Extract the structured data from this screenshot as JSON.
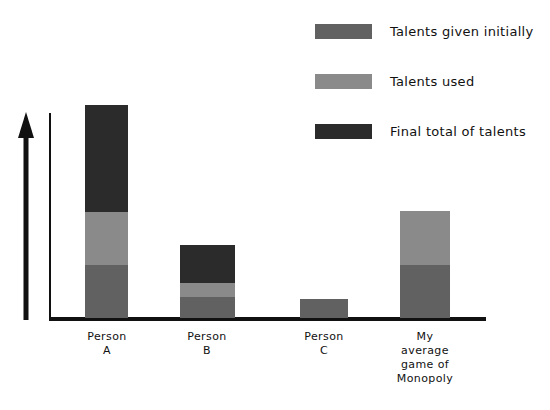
{
  "chart_data": {
    "type": "bar",
    "title": "",
    "xlabel": "",
    "ylabel": "",
    "stacked": true,
    "grid": false,
    "legend_position": "top-right",
    "y_axis": {
      "arrow": true,
      "ticks": [],
      "labels_shown": false,
      "range_hint": "unlabeled increasing axis"
    },
    "categories": [
      "Person\nA",
      "Person\nB",
      "Person\nC",
      "My\naverage\ngame of\nMonopoly"
    ],
    "series": [
      {
        "name": "Talents given initially",
        "color": "#616161",
        "values": [
          53,
          21,
          19,
          53
        ]
      },
      {
        "name": "Talents used",
        "color": "#8a8a8a",
        "values": [
          53,
          14,
          0,
          54
        ]
      },
      {
        "name": "Final total of talents",
        "color": "#2b2b2b",
        "values": [
          107,
          38,
          0,
          0
        ]
      }
    ]
  },
  "legend": {
    "items": [
      {
        "label": "Talents given initially",
        "color": "#616161"
      },
      {
        "label": "Talents used",
        "color": "#8a8a8a"
      },
      {
        "label": "Final total of talents",
        "color": "#2b2b2b"
      }
    ]
  },
  "axis": {
    "baseline_color": "#111111",
    "arrow_color": "#111111"
  },
  "bars": [
    {
      "name": "person-a",
      "label": "Person\nA",
      "left": 85,
      "width": 43,
      "label_left": 60,
      "label_width": 94,
      "segments": [
        {
          "kind": "given",
          "bottom": 0,
          "height": 53
        },
        {
          "kind": "used",
          "bottom": 53,
          "height": 53
        },
        {
          "kind": "final",
          "bottom": 106,
          "height": 107
        }
      ]
    },
    {
      "name": "person-b",
      "label": "Person\nB",
      "left": 180,
      "width": 55,
      "label_left": 160,
      "label_width": 94,
      "segments": [
        {
          "kind": "given",
          "bottom": 0,
          "height": 21
        },
        {
          "kind": "used",
          "bottom": 21,
          "height": 14
        },
        {
          "kind": "final",
          "bottom": 35,
          "height": 38
        }
      ]
    },
    {
      "name": "person-c",
      "label": "Person\nC",
      "left": 300,
      "width": 48,
      "label_left": 277,
      "label_width": 94,
      "segments": [
        {
          "kind": "given",
          "bottom": 0,
          "height": 19
        }
      ]
    },
    {
      "name": "monopoly",
      "label": "My\naverage\ngame of\nMonopoly",
      "left": 400,
      "width": 50,
      "label_left": 378,
      "label_width": 94,
      "segments": [
        {
          "kind": "given",
          "bottom": 0,
          "height": 53
        },
        {
          "kind": "used",
          "bottom": 53,
          "height": 54
        }
      ]
    }
  ]
}
